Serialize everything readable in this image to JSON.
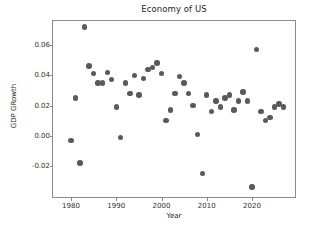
{
  "chart_data": {
    "type": "scatter",
    "title": "Economy of US",
    "xlabel": "Year",
    "ylabel": "GDP GRowth",
    "xlim": [
      1978.2,
      1978.2
    ],
    "ylim": [
      -0.0407,
      0.0793
    ],
    "xtick_labels": [
      "1980",
      "1990",
      "2000",
      "2010",
      "2020"
    ],
    "xticks": [
      1980,
      1990,
      2000,
      2010,
      2020
    ],
    "ytick_labels": [
      "0.06",
      "0.04",
      "0.02",
      "0.00",
      "-0.02"
    ],
    "yticks": [
      0.06,
      0.04,
      0.02,
      0.0,
      -0.02
    ],
    "grid": false,
    "legend": false,
    "marker_color": "#5a5a5a",
    "series": [
      {
        "name": "GDP Growth",
        "x": [
          1980,
          1981,
          1982,
          1983,
          1984,
          1985,
          1986,
          1987,
          1988,
          1989,
          1990,
          1991,
          1992,
          1993,
          1994,
          1995,
          1996,
          1997,
          1998,
          1999,
          2000,
          2001,
          2002,
          2003,
          2004,
          2005,
          2006,
          2007,
          2008,
          2009,
          2010,
          2011,
          2012,
          2013,
          2014,
          2015,
          2016,
          2017,
          2018,
          2019,
          2020,
          2021,
          2022,
          2023,
          2024,
          2025,
          2026,
          2027
        ],
        "y": [
          -0.003,
          0.025,
          -0.018,
          0.072,
          0.046,
          0.041,
          0.035,
          0.035,
          0.042,
          0.037,
          0.019,
          -0.001,
          0.035,
          0.028,
          0.04,
          0.027,
          0.038,
          0.044,
          0.045,
          0.048,
          0.041,
          0.01,
          0.017,
          0.028,
          0.039,
          0.035,
          0.028,
          0.02,
          0.001,
          -0.025,
          0.027,
          0.016,
          0.023,
          0.019,
          0.025,
          0.027,
          0.017,
          0.023,
          0.029,
          0.023,
          -0.034,
          0.057,
          0.016,
          0.01,
          0.012,
          0.019,
          0.021,
          0.019
        ]
      }
    ]
  },
  "axes": {
    "title": "Economy of US",
    "xlabel": "Year",
    "ylabel": "GDP GRowth"
  }
}
